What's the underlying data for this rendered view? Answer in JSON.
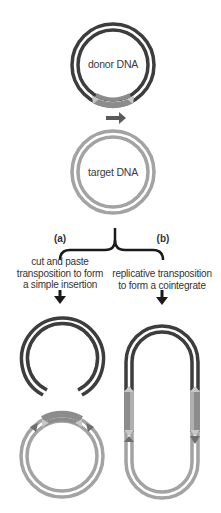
{
  "diagram": {
    "colors": {
      "donor": "#3d3d3d",
      "target": "#a3a3a3",
      "transposon": "#8c8c8c",
      "transposon_end": "#c8c8c8",
      "text": "#333333"
    },
    "donor": {
      "label": "donor DNA"
    },
    "target": {
      "label": "target DNA"
    },
    "branches": [
      {
        "id": "a",
        "tag": "(a)",
        "description_lines": [
          "cut and paste",
          "transposition to form",
          "a simple insertion"
        ]
      },
      {
        "id": "b",
        "tag": "(b)",
        "description_lines": [
          "replicative transposition",
          "to form a cointegrate"
        ]
      }
    ]
  }
}
